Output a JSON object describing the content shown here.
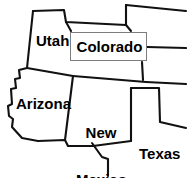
{
  "map": {
    "title": "Four Corners region state map",
    "background_color": "#ffffff",
    "border_color": "#000000",
    "callout_box": {
      "label": "Colorado",
      "fill_color": "#ffffff",
      "border_color": "#7d7d7d"
    },
    "labels": [
      {
        "id": "utah",
        "text": "Utah"
      },
      {
        "id": "colorado",
        "text": "Colorado"
      },
      {
        "id": "arizona",
        "text": "Arizona"
      },
      {
        "id": "newmexico_line1",
        "text": "New"
      },
      {
        "id": "newmexico_line2",
        "text": "Mexico"
      },
      {
        "id": "texas",
        "text": "Texas"
      }
    ],
    "states": {
      "utah": "Utah",
      "colorado": "Colorado",
      "arizona": "Arizona",
      "new_mexico": "New\nMexico",
      "texas": "Texas"
    }
  }
}
